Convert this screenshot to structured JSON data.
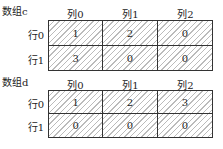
{
  "arrays": [
    {
      "name": "数组c",
      "columns": [
        "列0",
        "列1",
        "列2"
      ],
      "rows": [
        {
          "label": "行0",
          "values": [
            "1",
            "2",
            "0"
          ]
        },
        {
          "label": "行1",
          "values": [
            "3",
            "0",
            "0"
          ]
        }
      ]
    },
    {
      "name": "数组d",
      "columns": [
        "列0",
        "列1",
        "列2"
      ],
      "rows": [
        {
          "label": "行0",
          "values": [
            "1",
            "2",
            "3"
          ]
        },
        {
          "label": "行1",
          "values": [
            "0",
            "0",
            "0"
          ]
        }
      ]
    }
  ]
}
